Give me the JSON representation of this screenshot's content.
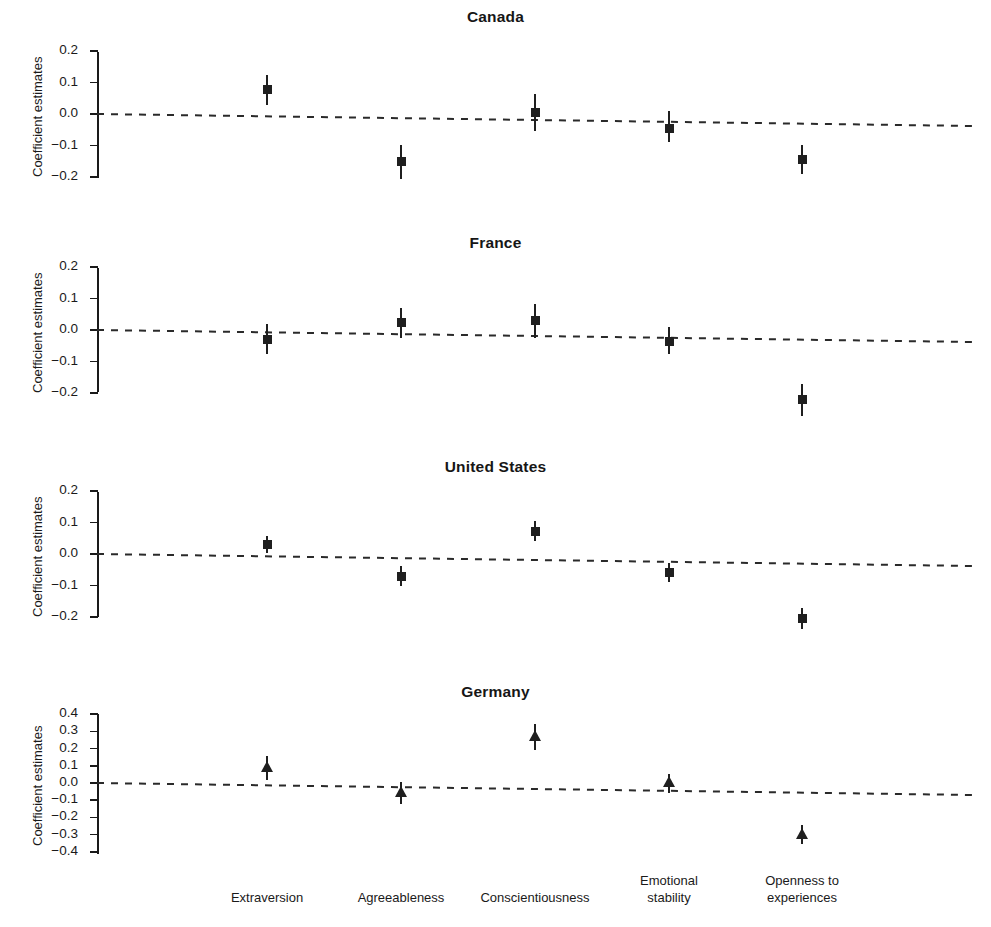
{
  "figure": {
    "ylabel": "Coefficient estimates",
    "categories": [
      {
        "lines": [
          "Extraversion"
        ]
      },
      {
        "lines": [
          "Agreeableness"
        ]
      },
      {
        "lines": [
          "Conscientiousness"
        ]
      },
      {
        "lines": [
          "Emotional",
          "stability"
        ]
      },
      {
        "lines": [
          "Openness to",
          "experiences"
        ]
      }
    ],
    "marker_color": "#1f1f1f",
    "zero_line_style": "dashed"
  },
  "chart_data": {
    "type": "scatter",
    "xlabel": "",
    "ylabel": "Coefficient estimates",
    "grid": false,
    "legend": "none",
    "zero_reference_line": 0.0,
    "categories": [
      "Extraversion",
      "Agreeableness",
      "Conscientiousness",
      "Emotional stability",
      "Openness to experiences"
    ],
    "panels": [
      {
        "title": "Canada",
        "marker": "square",
        "ylim": [
          -0.2,
          0.2
        ],
        "yticks": [
          0.2,
          0.1,
          0.0,
          -0.1,
          -0.2
        ],
        "ytick_labels": [
          "0.2",
          "0.1",
          "0.0",
          "−0.1",
          "−0.2"
        ],
        "values": [
          0.077,
          -0.15,
          0.005,
          -0.045,
          -0.145
        ],
        "ci_low": [
          0.03,
          -0.205,
          -0.055,
          -0.09,
          -0.19
        ],
        "ci_high": [
          0.125,
          -0.098,
          0.062,
          0.01,
          -0.098
        ]
      },
      {
        "title": "France",
        "marker": "square",
        "ylim": [
          -0.2,
          0.2
        ],
        "yticks": [
          0.2,
          0.1,
          0.0,
          -0.1,
          -0.2
        ],
        "ytick_labels": [
          "0.2",
          "0.1",
          "0.0",
          "−0.1",
          "−0.2"
        ],
        "values": [
          -0.03,
          0.023,
          0.03,
          -0.035,
          -0.222
        ],
        "ci_low": [
          -0.075,
          -0.025,
          -0.025,
          -0.075,
          -0.272
        ],
        "ci_high": [
          0.02,
          0.07,
          0.082,
          0.008,
          -0.172
        ]
      },
      {
        "title": "United States",
        "marker": "square",
        "ylim": [
          -0.2,
          0.2
        ],
        "yticks": [
          0.2,
          0.1,
          0.0,
          -0.1,
          -0.2
        ],
        "ytick_labels": [
          "0.2",
          "0.1",
          "0.0",
          "−0.1",
          "−0.2"
        ],
        "values": [
          0.03,
          -0.07,
          0.072,
          -0.06,
          -0.205
        ],
        "ci_low": [
          0.002,
          -0.102,
          0.04,
          -0.088,
          -0.238
        ],
        "ci_high": [
          0.058,
          -0.038,
          0.105,
          -0.03,
          -0.172
        ]
      },
      {
        "title": "Germany",
        "marker": "triangle",
        "ylim": [
          -0.4,
          0.4
        ],
        "yticks": [
          0.4,
          0.3,
          0.2,
          0.1,
          0.0,
          -0.1,
          -0.2,
          -0.3,
          -0.4
        ],
        "ytick_labels": [
          "0.4",
          "0.3",
          "0.2",
          "0.1",
          "0.0",
          "−0.1",
          "−0.2",
          "−0.3",
          "−0.4"
        ],
        "values": [
          0.09,
          -0.06,
          0.27,
          0.0,
          -0.3
        ],
        "ci_low": [
          0.02,
          -0.12,
          0.19,
          -0.058,
          -0.355
        ],
        "ci_high": [
          0.158,
          0.005,
          0.345,
          0.055,
          -0.245
        ]
      }
    ]
  }
}
